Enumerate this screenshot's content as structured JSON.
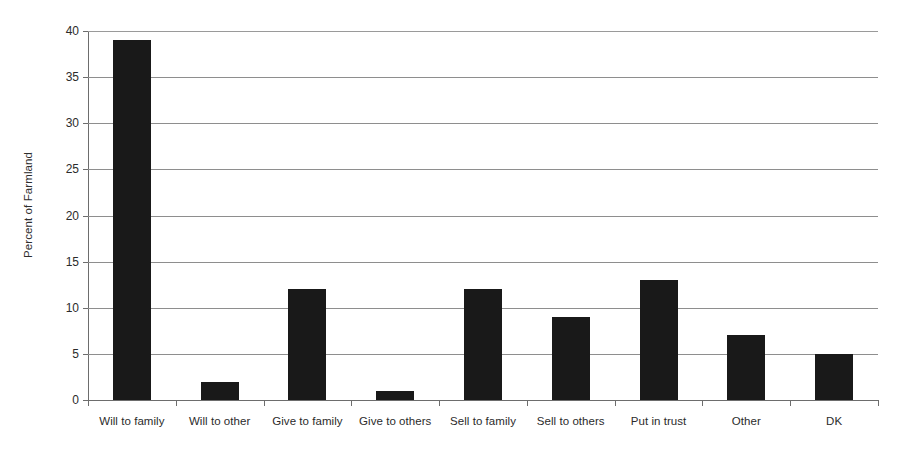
{
  "chart_data": {
    "type": "bar",
    "title": "",
    "subtitle": "",
    "xlabel": "",
    "ylabel": "Percent of Farmland",
    "categories": [
      "Will to family",
      "Will to other",
      "Give to family",
      "Give to others",
      "Sell to family",
      "Sell to others",
      "Put in trust",
      "Other",
      "DK"
    ],
    "values": [
      39,
      2,
      12,
      1,
      12,
      9,
      13,
      7,
      5
    ],
    "ylim": [
      0,
      40
    ],
    "ytick_values": [
      0,
      5,
      10,
      15,
      20,
      25,
      30,
      35,
      40
    ],
    "ytick_labels": [
      "0",
      "5",
      "10",
      "15",
      "20",
      "25",
      "30",
      "35",
      "40"
    ],
    "grid": true,
    "grid_axis": "y",
    "legend": false,
    "legend_position": "none",
    "bar_color": "#191919",
    "axis_color": "#6d6d6d",
    "gridline_color": "#8e8e8e",
    "background_color": "#ffffff"
  }
}
